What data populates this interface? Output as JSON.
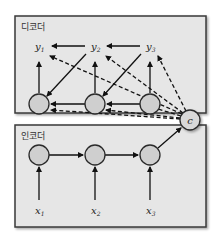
{
  "decoder": {
    "label": "디코더",
    "outputs": [
      {
        "base": "y",
        "sub": "1"
      },
      {
        "base": "y",
        "sub": "2"
      },
      {
        "base": "y",
        "sub": "3"
      }
    ]
  },
  "encoder": {
    "label": "인코더",
    "inputs": [
      {
        "base": "x",
        "sub": "1"
      },
      {
        "base": "x",
        "sub": "2"
      },
      {
        "base": "x",
        "sub": "3"
      }
    ]
  },
  "context": {
    "label": "c"
  },
  "colors": {
    "panel_fill": "#e6e6e6",
    "panel_stroke": "#3a3a3a",
    "node_fill": "#cfcfcf",
    "node_stroke": "#2a2a2a",
    "arrow": "#111111"
  }
}
